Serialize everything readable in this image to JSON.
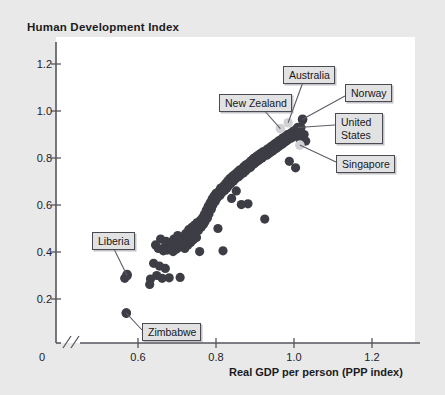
{
  "chart": {
    "title": "Human Development Index",
    "xlabel": "Real GDP per person (PPP index)",
    "axis_break_symbol": "//",
    "zero_label": "0"
  },
  "ticks": {
    "y": [
      "1.2",
      "1.0",
      "0.8",
      "0.6",
      "0.4",
      "0.2"
    ],
    "x": [
      "0.6",
      "0.8",
      "1.0",
      "1.2"
    ]
  },
  "callouts": {
    "new_zealand": "New Zealand",
    "australia": "Australia",
    "norway": "Norway",
    "united_states": "United States",
    "singapore": "Singapore",
    "liberia": "Liberia",
    "zimbabwe": "Zimbabwe"
  },
  "colors": {
    "page_background": "#e9e9e9",
    "plot_background": "#ffffff",
    "dot": "#3d3d45",
    "dot_highlight": "#d2d2d6",
    "axis": "#55555d",
    "callout_background": "#e2e2e2",
    "callout_border": "#4a4a52",
    "text": "#17171c"
  },
  "chart_data": {
    "type": "scatter",
    "title": "Human Development Index",
    "xlabel": "Real GDP per person (PPP index)",
    "ylabel": "Human Development Index",
    "xlim": [
      0.5,
      1.27
    ],
    "ylim": [
      0.0,
      1.3
    ],
    "xticks": [
      0.6,
      0.8,
      1.0,
      1.2
    ],
    "yticks": [
      0.2,
      0.4,
      0.6,
      0.8,
      1.0,
      1.2
    ],
    "grid": false,
    "legend": "none",
    "axis_break_x": true,
    "annotations": [
      {
        "label": "New Zealand",
        "x": 0.965,
        "y": 0.925,
        "highlight": true
      },
      {
        "label": "Australia",
        "x": 0.985,
        "y": 0.95,
        "highlight": true
      },
      {
        "label": "Norway",
        "x": 1.022,
        "y": 0.965,
        "highlight": false
      },
      {
        "label": "United States",
        "x": 1.01,
        "y": 0.93,
        "highlight": false
      },
      {
        "label": "Singapore",
        "x": 1.015,
        "y": 0.855,
        "highlight": true
      },
      {
        "label": "Liberia",
        "x": 0.572,
        "y": 0.3,
        "highlight": false
      },
      {
        "label": "Zimbabwe",
        "x": 0.57,
        "y": 0.14,
        "highlight": false
      }
    ],
    "points": [
      [
        0.572,
        0.305
      ],
      [
        0.566,
        0.288
      ],
      [
        0.57,
        0.14
      ],
      [
        0.63,
        0.262
      ],
      [
        0.632,
        0.285
      ],
      [
        0.64,
        0.352
      ],
      [
        0.645,
        0.43
      ],
      [
        0.648,
        0.3
      ],
      [
        0.652,
        0.415
      ],
      [
        0.655,
        0.34
      ],
      [
        0.658,
        0.455
      ],
      [
        0.662,
        0.288
      ],
      [
        0.665,
        0.405
      ],
      [
        0.668,
        0.42
      ],
      [
        0.67,
        0.33
      ],
      [
        0.672,
        0.445
      ],
      [
        0.675,
        0.408
      ],
      [
        0.678,
        0.425
      ],
      [
        0.68,
        0.29
      ],
      [
        0.682,
        0.44
      ],
      [
        0.685,
        0.418
      ],
      [
        0.688,
        0.432
      ],
      [
        0.69,
        0.402
      ],
      [
        0.692,
        0.455
      ],
      [
        0.695,
        0.425
      ],
      [
        0.698,
        0.412
      ],
      [
        0.7,
        0.438
      ],
      [
        0.702,
        0.47
      ],
      [
        0.705,
        0.42
      ],
      [
        0.708,
        0.292
      ],
      [
        0.71,
        0.445
      ],
      [
        0.712,
        0.428
      ],
      [
        0.715,
        0.46
      ],
      [
        0.718,
        0.435
      ],
      [
        0.72,
        0.415
      ],
      [
        0.722,
        0.478
      ],
      [
        0.725,
        0.448
      ],
      [
        0.728,
        0.43
      ],
      [
        0.73,
        0.495
      ],
      [
        0.732,
        0.462
      ],
      [
        0.735,
        0.44
      ],
      [
        0.738,
        0.505
      ],
      [
        0.74,
        0.472
      ],
      [
        0.742,
        0.452
      ],
      [
        0.745,
        0.515
      ],
      [
        0.748,
        0.485
      ],
      [
        0.75,
        0.462
      ],
      [
        0.752,
        0.525
      ],
      [
        0.755,
        0.492
      ],
      [
        0.758,
        0.402
      ],
      [
        0.76,
        0.535
      ],
      [
        0.762,
        0.505
      ],
      [
        0.765,
        0.545
      ],
      [
        0.768,
        0.518
      ],
      [
        0.77,
        0.56
      ],
      [
        0.772,
        0.53
      ],
      [
        0.775,
        0.578
      ],
      [
        0.778,
        0.545
      ],
      [
        0.78,
        0.595
      ],
      [
        0.782,
        0.562
      ],
      [
        0.785,
        0.61
      ],
      [
        0.788,
        0.582
      ],
      [
        0.79,
        0.625
      ],
      [
        0.792,
        0.6
      ],
      [
        0.795,
        0.638
      ],
      [
        0.798,
        0.615
      ],
      [
        0.8,
        0.65
      ],
      [
        0.802,
        0.628
      ],
      [
        0.805,
        0.5
      ],
      [
        0.808,
        0.66
      ],
      [
        0.81,
        0.64
      ],
      [
        0.812,
        0.672
      ],
      [
        0.815,
        0.652
      ],
      [
        0.818,
        0.405
      ],
      [
        0.82,
        0.682
      ],
      [
        0.822,
        0.662
      ],
      [
        0.825,
        0.692
      ],
      [
        0.828,
        0.672
      ],
      [
        0.83,
        0.702
      ],
      [
        0.832,
        0.682
      ],
      [
        0.835,
        0.712
      ],
      [
        0.838,
        0.692
      ],
      [
        0.84,
        0.628
      ],
      [
        0.842,
        0.722
      ],
      [
        0.845,
        0.702
      ],
      [
        0.848,
        0.73
      ],
      [
        0.85,
        0.712
      ],
      [
        0.852,
        0.66
      ],
      [
        0.855,
        0.74
      ],
      [
        0.858,
        0.72
      ],
      [
        0.86,
        0.748
      ],
      [
        0.862,
        0.728
      ],
      [
        0.865,
        0.602
      ],
      [
        0.868,
        0.756
      ],
      [
        0.87,
        0.736
      ],
      [
        0.872,
        0.764
      ],
      [
        0.875,
        0.744
      ],
      [
        0.878,
        0.772
      ],
      [
        0.88,
        0.752
      ],
      [
        0.882,
        0.605
      ],
      [
        0.885,
        0.78
      ],
      [
        0.888,
        0.76
      ],
      [
        0.89,
        0.788
      ],
      [
        0.892,
        0.768
      ],
      [
        0.895,
        0.796
      ],
      [
        0.898,
        0.776
      ],
      [
        0.9,
        0.802
      ],
      [
        0.902,
        0.782
      ],
      [
        0.905,
        0.808
      ],
      [
        0.908,
        0.788
      ],
      [
        0.91,
        0.814
      ],
      [
        0.912,
        0.794
      ],
      [
        0.915,
        0.82
      ],
      [
        0.918,
        0.8
      ],
      [
        0.92,
        0.826
      ],
      [
        0.922,
        0.806
      ],
      [
        0.925,
        0.54
      ],
      [
        0.928,
        0.832
      ],
      [
        0.93,
        0.812
      ],
      [
        0.932,
        0.838
      ],
      [
        0.935,
        0.818
      ],
      [
        0.938,
        0.844
      ],
      [
        0.94,
        0.824
      ],
      [
        0.942,
        0.85
      ],
      [
        0.945,
        0.83
      ],
      [
        0.948,
        0.856
      ],
      [
        0.95,
        0.836
      ],
      [
        0.952,
        0.862
      ],
      [
        0.955,
        0.842
      ],
      [
        0.958,
        0.868
      ],
      [
        0.96,
        0.848
      ],
      [
        0.962,
        0.874
      ],
      [
        0.965,
        0.854
      ],
      [
        0.968,
        0.88
      ],
      [
        0.97,
        0.86
      ],
      [
        0.972,
        0.886
      ],
      [
        0.975,
        0.866
      ],
      [
        0.978,
        0.892
      ],
      [
        0.98,
        0.872
      ],
      [
        0.982,
        0.898
      ],
      [
        0.985,
        0.878
      ],
      [
        0.988,
        0.786
      ],
      [
        0.99,
        0.904
      ],
      [
        0.992,
        0.884
      ],
      [
        0.995,
        0.91
      ],
      [
        0.998,
        0.89
      ],
      [
        1.0,
        0.916
      ],
      [
        1.002,
        0.896
      ],
      [
        1.004,
        0.758
      ],
      [
        1.006,
        0.922
      ],
      [
        1.008,
        0.902
      ],
      [
        1.01,
        0.928
      ],
      [
        1.012,
        0.908
      ],
      [
        1.015,
        0.88
      ],
      [
        1.018,
        0.93
      ],
      [
        1.022,
        0.962
      ],
      [
        1.026,
        0.9
      ],
      [
        1.03,
        0.872
      ]
    ]
  }
}
